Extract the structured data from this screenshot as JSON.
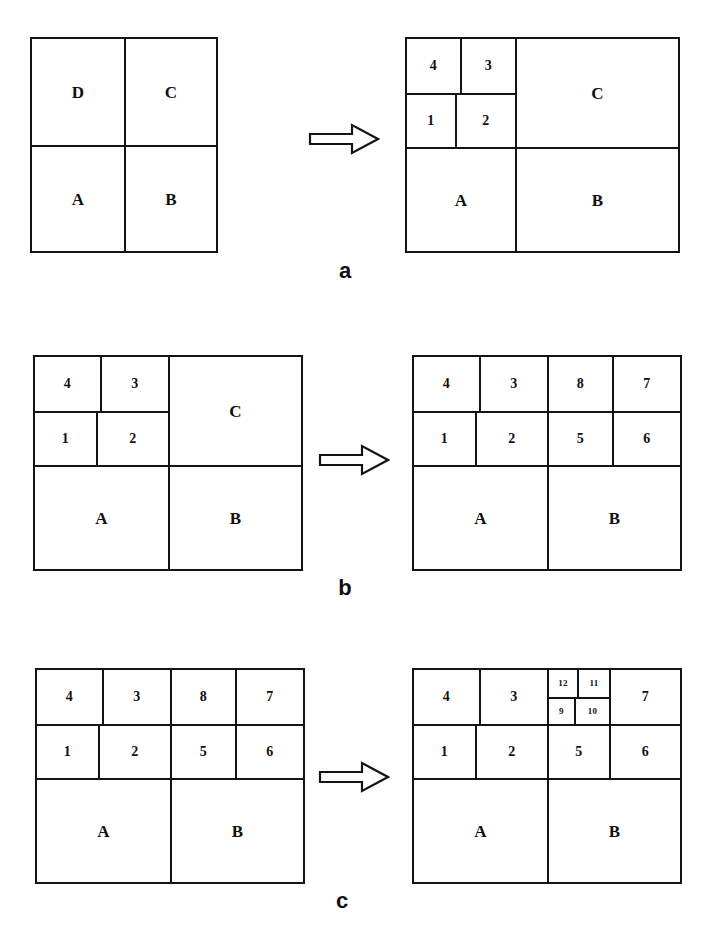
{
  "figure": {
    "type": "recursive-quadrant-subdivision-diagram",
    "background_color": "#ffffff",
    "line_color": "#141414",
    "rows": [
      {
        "caption": "a",
        "left_diagram": {
          "name": "initial-quadrants",
          "cells": [
            {
              "label": "D"
            },
            {
              "label": "C"
            },
            {
              "label": "A"
            },
            {
              "label": "B"
            }
          ]
        },
        "right_diagram": {
          "name": "d-quadrant-subdivided",
          "cells": [
            {
              "label": "4"
            },
            {
              "label": "3"
            },
            {
              "label": "1"
            },
            {
              "label": "2"
            },
            {
              "label": "C"
            },
            {
              "label": "A"
            },
            {
              "label": "B"
            }
          ]
        },
        "arrow": "right-arrow-icon"
      },
      {
        "caption": "b",
        "left_diagram": {
          "name": "d-quadrant-subdivided",
          "cells": [
            {
              "label": "4"
            },
            {
              "label": "3"
            },
            {
              "label": "1"
            },
            {
              "label": "2"
            },
            {
              "label": "C"
            },
            {
              "label": "A"
            },
            {
              "label": "B"
            }
          ]
        },
        "right_diagram": {
          "name": "c-quadrant-subdivided",
          "cells": [
            {
              "label": "4"
            },
            {
              "label": "3"
            },
            {
              "label": "8"
            },
            {
              "label": "7"
            },
            {
              "label": "1"
            },
            {
              "label": "2"
            },
            {
              "label": "5"
            },
            {
              "label": "6"
            },
            {
              "label": "A"
            },
            {
              "label": "B"
            }
          ]
        },
        "arrow": "right-arrow-icon"
      },
      {
        "caption": "c",
        "left_diagram": {
          "name": "c-quadrant-subdivided",
          "cells": [
            {
              "label": "4"
            },
            {
              "label": "3"
            },
            {
              "label": "8"
            },
            {
              "label": "7"
            },
            {
              "label": "1"
            },
            {
              "label": "2"
            },
            {
              "label": "5"
            },
            {
              "label": "6"
            },
            {
              "label": "A"
            },
            {
              "label": "B"
            }
          ]
        },
        "right_diagram": {
          "name": "cell-eight-subdivided",
          "cells": [
            {
              "label": "4"
            },
            {
              "label": "3"
            },
            {
              "label": "12"
            },
            {
              "label": "11"
            },
            {
              "label": "9"
            },
            {
              "label": "10"
            },
            {
              "label": "7"
            },
            {
              "label": "1"
            },
            {
              "label": "2"
            },
            {
              "label": "5"
            },
            {
              "label": "6"
            },
            {
              "label": "A"
            },
            {
              "label": "B"
            }
          ]
        },
        "arrow": "right-arrow-icon"
      }
    ]
  }
}
